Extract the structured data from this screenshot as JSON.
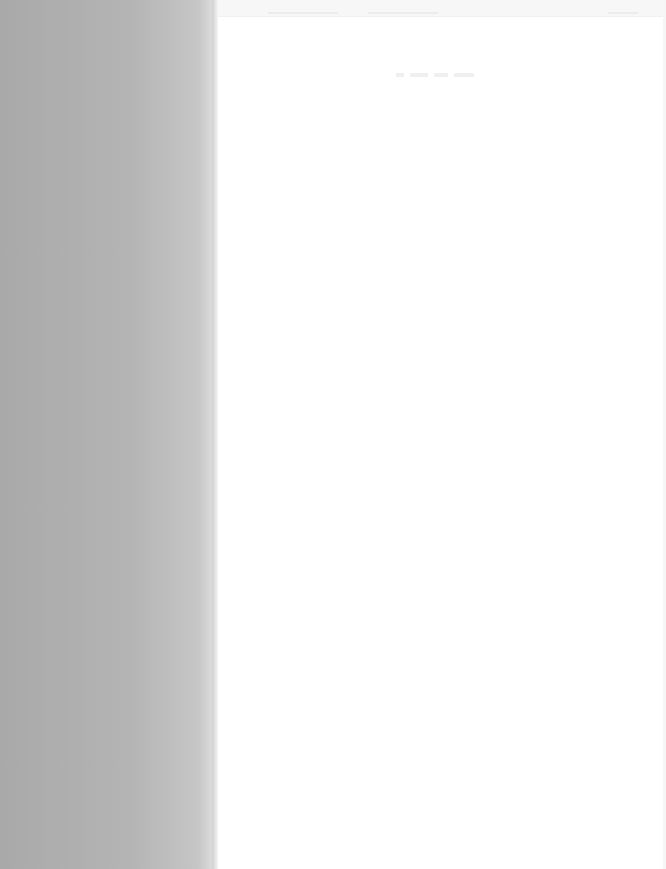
{
  "window": {
    "title": "",
    "state": "faded / washed-out capture — no legible text"
  },
  "sidebar": {
    "items": []
  },
  "toolbar": {
    "items": []
  },
  "main": {
    "heading": "",
    "content": []
  },
  "colors": {
    "sidebar_dark": "#a9a9a9",
    "sidebar_light": "#c6c6c6",
    "main_background": "#ffffff",
    "toolbar_background": "#f7f7f7"
  }
}
